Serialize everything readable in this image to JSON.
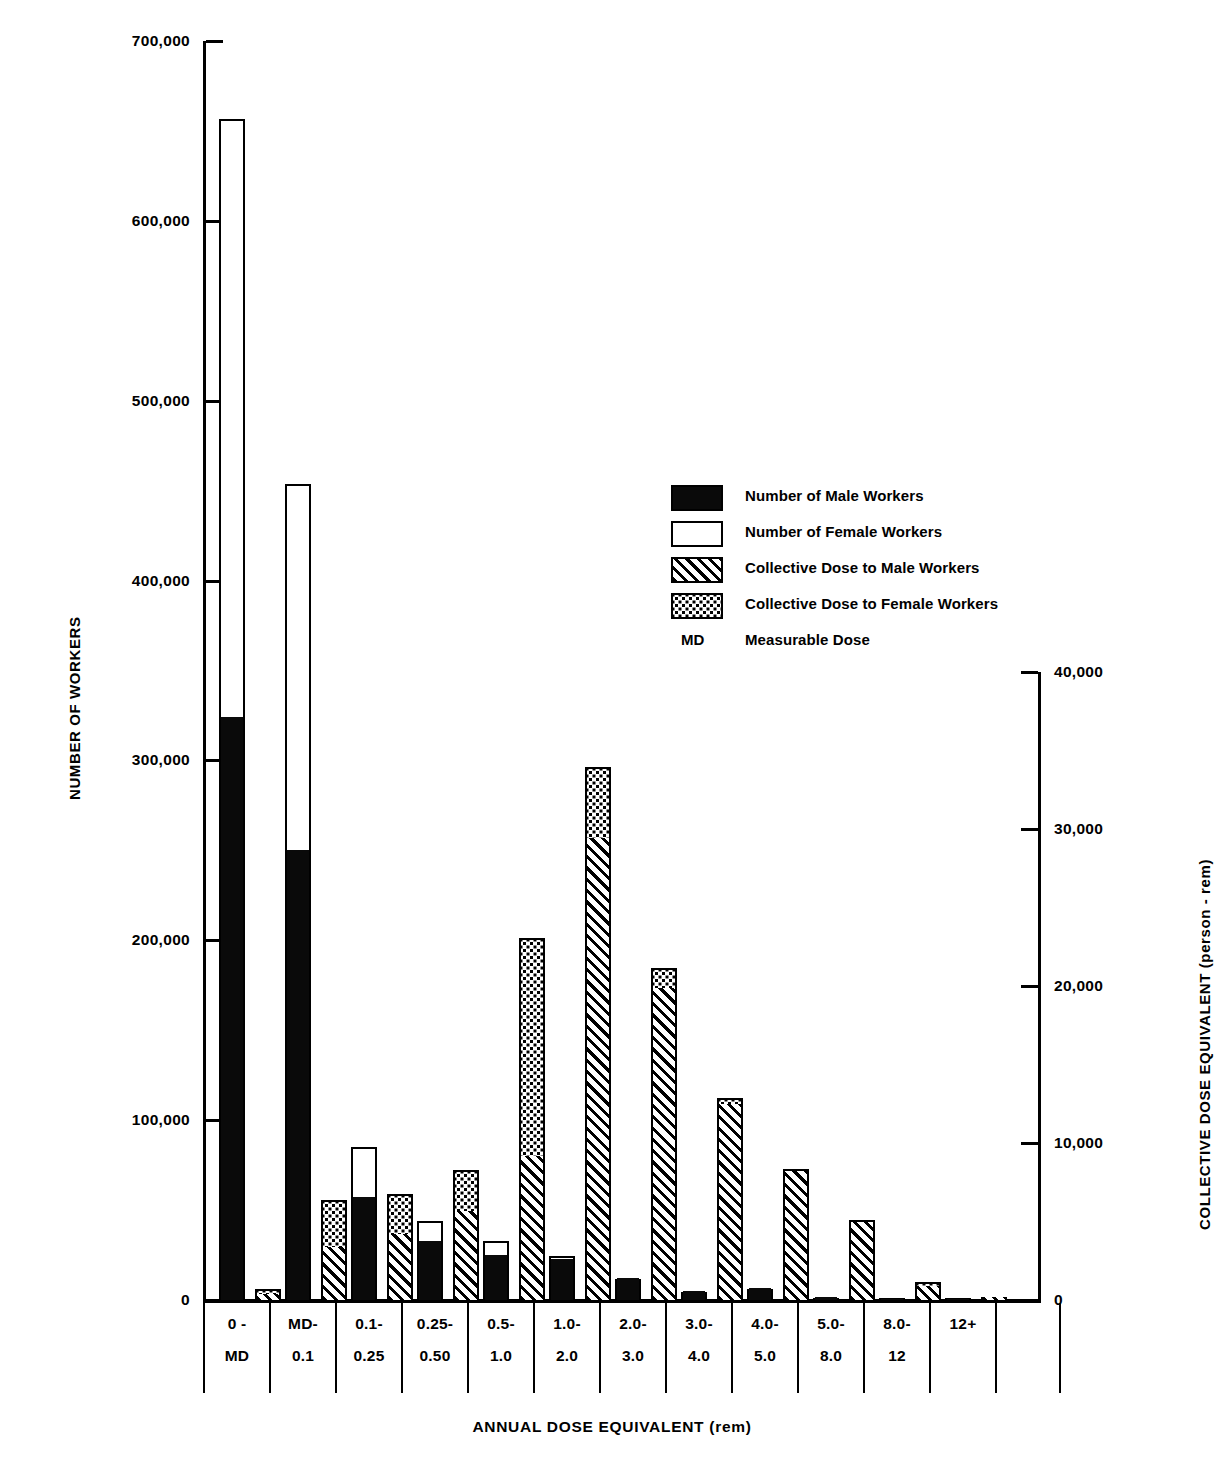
{
  "chart_data": {
    "type": "bar",
    "title": "",
    "xlabel": "ANNUAL DOSE EQUIVALENT (rem)",
    "ylabel_left": "NUMBER OF WORKERS",
    "ylabel_right": "COLLECTIVE DOSE EQUIVALENT  (person - rem)",
    "grid": false,
    "legend_position": "inside-upper-right",
    "categories": [
      "0 - MD",
      "MD- 0.1",
      "0.1- 0.25",
      "0.25- 0.50",
      "0.5- 1.0",
      "1.0- 2.0",
      "2.0- 3.0",
      "3.0- 4.0",
      "4.0- 5.0",
      "5.0- 8.0",
      "8.0- 12",
      "12+"
    ],
    "category_lines": [
      [
        "0 -",
        "MD"
      ],
      [
        "MD-",
        "0.1"
      ],
      [
        "0.1-",
        "0.25"
      ],
      [
        "0.25-",
        "0.50"
      ],
      [
        "0.5-",
        "1.0"
      ],
      [
        "1.0-",
        "2.0"
      ],
      [
        "2.0-",
        "3.0"
      ],
      [
        "3.0-",
        "4.0"
      ],
      [
        "4.0-",
        "5.0"
      ],
      [
        "5.0-",
        "8.0"
      ],
      [
        "8.0-",
        "12"
      ],
      [
        "12+",
        ""
      ]
    ],
    "left_axis": {
      "label": "NUMBER OF WORKERS",
      "ylim": [
        0,
        700000
      ],
      "ticks": [
        0,
        100000,
        200000,
        300000,
        400000,
        500000,
        600000,
        700000
      ],
      "tick_labels": [
        "0",
        "100,000",
        "200,000",
        "300,000",
        "400,000",
        "500,000",
        "600,000",
        "700,000"
      ]
    },
    "right_axis": {
      "label": "COLLECTIVE DOSE EQUIVALENT  (person - rem)",
      "ylim": [
        0,
        40000
      ],
      "ticks": [
        0,
        10000,
        20000,
        30000,
        40000
      ],
      "tick_labels": [
        "0",
        "10,000",
        "20,000",
        "30,000",
        "40,000"
      ]
    },
    "series": [
      {
        "name": "Number of Male Workers",
        "axis": "left",
        "pattern": "solid-black",
        "values": [
          324000,
          250000,
          57000,
          33000,
          25000,
          23000,
          12000,
          5000,
          6500,
          1500,
          700,
          300
        ]
      },
      {
        "name": "Number of Female Workers",
        "axis": "left",
        "pattern": "white",
        "values": [
          334000,
          205000,
          29000,
          12000,
          9000,
          2500,
          1000,
          500,
          500,
          300,
          200,
          100
        ]
      },
      {
        "name": "Collective Dose to Male Workers",
        "axis": "right",
        "pattern": "diagonal-hatch",
        "values": [
          400,
          3400,
          4200,
          5700,
          9200,
          29400,
          19900,
          12500,
          8200,
          5000,
          900,
          200
        ]
      },
      {
        "name": "Collective Dose to Female Workers",
        "axis": "right",
        "pattern": "stipple",
        "values": [
          400,
          3100,
          2700,
          2700,
          14000,
          4700,
          1400,
          500,
          300,
          200,
          400,
          100
        ]
      }
    ],
    "totals_workers": [
      658000,
      455000,
      86000,
      45000,
      34000,
      25500,
      13000,
      5500,
      7000,
      1800,
      900,
      400
    ],
    "totals_dose": [
      800,
      6500,
      6900,
      8400,
      23200,
      34100,
      21300,
      13000,
      8500,
      5200,
      1300,
      300
    ]
  },
  "legend": {
    "items": [
      {
        "label": "Number of Male Workers",
        "swatch": "solid-black"
      },
      {
        "label": "Number of Female Workers",
        "swatch": "white"
      },
      {
        "label": "Collective Dose to Male Workers",
        "swatch": "diagonal-hatch"
      },
      {
        "label": "Collective Dose to Female Workers",
        "swatch": "stipple"
      }
    ],
    "abbrev_key": "MD",
    "abbrev_text": "Measurable Dose"
  },
  "colors": {
    "ink": "#000000",
    "paper": "#ffffff"
  }
}
